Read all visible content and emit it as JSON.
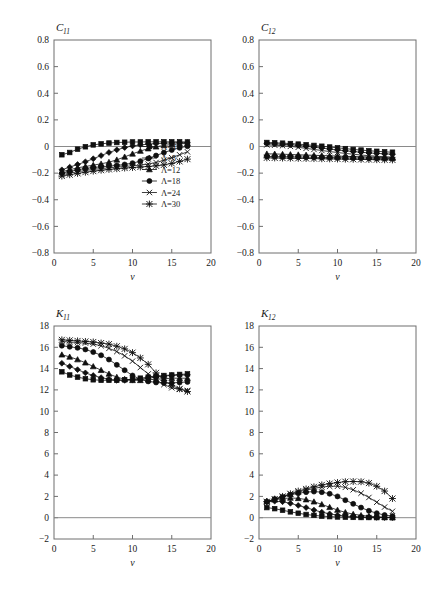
{
  "figure": {
    "panel_count": 4,
    "legend_entries": [
      "Λ=4",
      "Λ=8",
      "Λ=12",
      "Λ=18",
      "Λ=24",
      "Λ=30"
    ],
    "legend_markers": [
      "square",
      "diamond",
      "triangle",
      "circle",
      "cross",
      "asterisk"
    ],
    "line_color": "#101010",
    "frame_color": "#6e6e6e"
  },
  "chart_data": [
    {
      "type": "line",
      "title": "C",
      "title_sub": "11",
      "panel": "top-left",
      "xlabel": "v",
      "ylabel": "",
      "xlim": [
        0,
        20
      ],
      "ylim": [
        -0.8,
        0.8
      ],
      "xticks": [
        0,
        5,
        10,
        15,
        20
      ],
      "yticks": [
        -0.8,
        -0.6,
        -0.4,
        -0.2,
        0,
        0.2,
        0.4,
        0.6,
        0.8
      ],
      "xticklabels": [
        "0",
        "5",
        "10",
        "15",
        "20"
      ],
      "yticklabels": [
        "-0.8",
        "-0.6",
        "-0.4",
        "-0.2",
        "0",
        "0.2",
        "0.4",
        "0.6",
        "0.8"
      ],
      "grid": false,
      "zero_line": true,
      "legend_position": "lower-right",
      "show_legend": true,
      "x": [
        1,
        2,
        3,
        4,
        5,
        6,
        7,
        8,
        9,
        10,
        11,
        12,
        13,
        14,
        15,
        16,
        17
      ],
      "series": [
        {
          "name": "Λ=4",
          "marker": "square",
          "values": [
            -0.062,
            -0.045,
            -0.02,
            -0.002,
            0.012,
            0.02,
            0.026,
            0.03,
            0.032,
            0.034,
            0.034,
            0.035,
            0.035,
            0.035,
            0.035,
            0.035,
            0.034
          ]
        },
        {
          "name": "Λ=8",
          "marker": "diamond",
          "values": [
            -0.175,
            -0.155,
            -0.135,
            -0.115,
            -0.092,
            -0.068,
            -0.045,
            -0.025,
            -0.008,
            0.004,
            0.012,
            0.018,
            0.022,
            0.025,
            0.027,
            0.028,
            0.029
          ]
        },
        {
          "name": "Λ=12",
          "marker": "triangle",
          "values": [
            -0.19,
            -0.175,
            -0.16,
            -0.15,
            -0.14,
            -0.13,
            -0.118,
            -0.1,
            -0.078,
            -0.055,
            -0.034,
            -0.016,
            -0.002,
            0.008,
            0.015,
            0.02,
            0.024
          ]
        },
        {
          "name": "Λ=18",
          "marker": "circle",
          "values": [
            -0.2,
            -0.188,
            -0.175,
            -0.165,
            -0.158,
            -0.152,
            -0.147,
            -0.142,
            -0.135,
            -0.125,
            -0.11,
            -0.09,
            -0.068,
            -0.046,
            -0.026,
            -0.01,
            0.002
          ]
        },
        {
          "name": "Λ=24",
          "marker": "cross",
          "values": [
            -0.212,
            -0.2,
            -0.19,
            -0.18,
            -0.172,
            -0.166,
            -0.16,
            -0.155,
            -0.15,
            -0.145,
            -0.14,
            -0.132,
            -0.12,
            -0.104,
            -0.084,
            -0.062,
            -0.04
          ]
        },
        {
          "name": "Λ=30",
          "marker": "asterisk",
          "values": [
            -0.222,
            -0.212,
            -0.202,
            -0.193,
            -0.185,
            -0.178,
            -0.172,
            -0.167,
            -0.162,
            -0.158,
            -0.154,
            -0.15,
            -0.145,
            -0.138,
            -0.127,
            -0.112,
            -0.095
          ]
        }
      ]
    },
    {
      "type": "line",
      "title": "C",
      "title_sub": "12",
      "panel": "top-right",
      "xlabel": "v",
      "ylabel": "",
      "xlim": [
        0,
        20
      ],
      "ylim": [
        -0.8,
        0.8
      ],
      "xticks": [
        0,
        5,
        10,
        15,
        20
      ],
      "yticks": [
        -0.8,
        -0.6,
        -0.4,
        -0.2,
        0,
        0.2,
        0.4,
        0.6,
        0.8
      ],
      "xticklabels": [
        "0",
        "5",
        "10",
        "15",
        "20"
      ],
      "yticklabels": [
        "-0.8",
        "-0.6",
        "-0.4",
        "-0.2",
        "0",
        "0.2",
        "0.4",
        "0.6",
        "0.8"
      ],
      "grid": false,
      "zero_line": true,
      "legend_position": "none",
      "show_legend": false,
      "x": [
        1,
        2,
        3,
        4,
        5,
        6,
        7,
        8,
        9,
        10,
        11,
        12,
        13,
        14,
        15,
        16,
        17
      ],
      "series": [
        {
          "name": "Λ=4",
          "marker": "square",
          "values": [
            0.03,
            0.028,
            0.025,
            0.022,
            0.018,
            0.013,
            0.008,
            0.002,
            -0.004,
            -0.01,
            -0.016,
            -0.022,
            -0.027,
            -0.032,
            -0.036,
            -0.04,
            -0.043
          ]
        },
        {
          "name": "Λ=8",
          "marker": "diamond",
          "values": [
            0.022,
            0.02,
            0.017,
            0.013,
            0.008,
            0.002,
            -0.005,
            -0.012,
            -0.019,
            -0.026,
            -0.032,
            -0.038,
            -0.043,
            -0.048,
            -0.052,
            -0.055,
            -0.058
          ]
        },
        {
          "name": "Λ=12",
          "marker": "triangle",
          "values": [
            -0.055,
            -0.056,
            -0.058,
            -0.06,
            -0.062,
            -0.064,
            -0.066,
            -0.068,
            -0.07,
            -0.072,
            -0.074,
            -0.076,
            -0.078,
            -0.08,
            -0.082,
            -0.084,
            -0.086
          ]
        },
        {
          "name": "Λ=18",
          "marker": "circle",
          "values": [
            -0.075,
            -0.076,
            -0.077,
            -0.078,
            -0.079,
            -0.08,
            -0.081,
            -0.082,
            -0.083,
            -0.084,
            -0.085,
            -0.086,
            -0.087,
            -0.088,
            -0.089,
            -0.09,
            -0.091
          ]
        },
        {
          "name": "Λ=24",
          "marker": "cross",
          "values": [
            0.012,
            0.01,
            0.006,
            0.001,
            -0.006,
            -0.014,
            -0.022,
            -0.03,
            -0.038,
            -0.045,
            -0.052,
            -0.058,
            -0.064,
            -0.069,
            -0.073,
            -0.077,
            -0.08
          ]
        },
        {
          "name": "Λ=30",
          "marker": "asterisk",
          "values": [
            -0.085,
            -0.086,
            -0.087,
            -0.088,
            -0.089,
            -0.09,
            -0.091,
            -0.092,
            -0.093,
            -0.094,
            -0.095,
            -0.096,
            -0.097,
            -0.098,
            -0.099,
            -0.1,
            -0.101
          ]
        }
      ]
    },
    {
      "type": "line",
      "title": "K",
      "title_sub": "11",
      "panel": "bottom-left",
      "xlabel": "v",
      "ylabel": "",
      "xlim": [
        0,
        20
      ],
      "ylim": [
        -2,
        18
      ],
      "xticks": [
        0,
        5,
        10,
        15,
        20
      ],
      "yticks": [
        -2,
        0,
        2,
        4,
        6,
        8,
        10,
        12,
        14,
        16,
        18
      ],
      "xticklabels": [
        "0",
        "5",
        "10",
        "15",
        "20"
      ],
      "yticklabels": [
        "-2",
        "0",
        "2",
        "4",
        "6",
        "8",
        "10",
        "12",
        "14",
        "16",
        "18"
      ],
      "grid": false,
      "zero_line": true,
      "legend_position": "none",
      "show_legend": false,
      "x": [
        1,
        2,
        3,
        4,
        5,
        6,
        7,
        8,
        9,
        10,
        11,
        12,
        13,
        14,
        15,
        16,
        17
      ],
      "series": [
        {
          "name": "Λ=4",
          "marker": "square",
          "values": [
            13.7,
            13.4,
            13.2,
            13.05,
            12.95,
            12.9,
            12.9,
            12.9,
            12.95,
            13.0,
            13.1,
            13.2,
            13.3,
            13.35,
            13.4,
            13.45,
            13.5
          ]
        },
        {
          "name": "Λ=8",
          "marker": "diamond",
          "values": [
            14.5,
            14.2,
            13.9,
            13.6,
            13.35,
            13.15,
            13.0,
            12.9,
            12.9,
            12.95,
            13.0,
            13.1,
            13.2,
            13.3,
            13.35,
            13.4,
            13.4
          ]
        },
        {
          "name": "Λ=12",
          "marker": "triangle",
          "values": [
            15.3,
            15.1,
            14.85,
            14.55,
            14.2,
            13.85,
            13.5,
            13.2,
            13.0,
            12.9,
            12.9,
            12.95,
            13.0,
            13.05,
            13.1,
            13.1,
            13.1
          ]
        },
        {
          "name": "Λ=18",
          "marker": "circle",
          "values": [
            16.15,
            16.05,
            15.95,
            15.8,
            15.55,
            15.25,
            14.85,
            14.35,
            13.85,
            13.35,
            13.0,
            12.8,
            12.7,
            12.65,
            12.65,
            12.7,
            12.75
          ]
        },
        {
          "name": "Λ=24",
          "marker": "cross",
          "values": [
            16.55,
            16.5,
            16.45,
            16.4,
            16.3,
            16.15,
            15.9,
            15.6,
            15.2,
            14.7,
            14.1,
            13.5,
            12.95,
            12.5,
            12.2,
            12.05,
            11.95
          ]
        },
        {
          "name": "Λ=30",
          "marker": "asterisk",
          "values": [
            16.7,
            16.65,
            16.6,
            16.55,
            16.5,
            16.4,
            16.3,
            16.1,
            15.85,
            15.5,
            15.0,
            14.4,
            13.6,
            12.9,
            12.4,
            12.1,
            11.85
          ]
        }
      ]
    },
    {
      "type": "line",
      "title": "K",
      "title_sub": "12",
      "panel": "bottom-right",
      "xlabel": "v",
      "ylabel": "",
      "xlim": [
        0,
        20
      ],
      "ylim": [
        -2,
        18
      ],
      "xticks": [
        0,
        5,
        10,
        15,
        20
      ],
      "yticks": [
        -2,
        0,
        2,
        4,
        6,
        8,
        10,
        12,
        14,
        16,
        18
      ],
      "xticklabels": [
        "0",
        "5",
        "10",
        "15",
        "20"
      ],
      "yticklabels": [
        "-2",
        "0",
        "2",
        "4",
        "6",
        "8",
        "10",
        "12",
        "14",
        "16",
        "18"
      ],
      "grid": false,
      "zero_line": true,
      "legend_position": "none",
      "show_legend": false,
      "x": [
        1,
        2,
        3,
        4,
        5,
        6,
        7,
        8,
        9,
        10,
        11,
        12,
        13,
        14,
        15,
        16,
        17
      ],
      "series": [
        {
          "name": "Λ=4",
          "marker": "square",
          "values": [
            0.95,
            0.85,
            0.7,
            0.55,
            0.42,
            0.3,
            0.22,
            0.15,
            0.1,
            0.07,
            0.05,
            0.03,
            0.02,
            0.02,
            0.01,
            0.01,
            0.0
          ]
        },
        {
          "name": "Λ=8",
          "marker": "diamond",
          "values": [
            1.5,
            1.55,
            1.5,
            1.35,
            1.15,
            0.95,
            0.72,
            0.52,
            0.36,
            0.24,
            0.16,
            0.1,
            0.07,
            0.05,
            0.03,
            0.02,
            0.01
          ]
        },
        {
          "name": "Λ=12",
          "marker": "triangle",
          "values": [
            1.55,
            1.7,
            1.8,
            1.85,
            1.82,
            1.7,
            1.5,
            1.25,
            0.98,
            0.72,
            0.5,
            0.33,
            0.22,
            0.14,
            0.09,
            0.05,
            0.03
          ]
        },
        {
          "name": "Λ=18",
          "marker": "circle",
          "values": [
            1.5,
            1.75,
            1.95,
            2.15,
            2.3,
            2.4,
            2.45,
            2.4,
            2.25,
            2.0,
            1.65,
            1.3,
            0.95,
            0.65,
            0.42,
            0.25,
            0.15
          ]
        },
        {
          "name": "Λ=24",
          "marker": "cross",
          "values": [
            1.45,
            1.7,
            1.95,
            2.2,
            2.42,
            2.6,
            2.75,
            2.88,
            2.95,
            2.95,
            2.85,
            2.62,
            2.3,
            1.9,
            1.45,
            1.0,
            0.6
          ]
        },
        {
          "name": "Λ=30",
          "marker": "asterisk",
          "values": [
            1.5,
            1.75,
            2.0,
            2.25,
            2.5,
            2.7,
            2.9,
            3.08,
            3.2,
            3.3,
            3.38,
            3.4,
            3.38,
            3.25,
            2.95,
            2.5,
            1.8
          ]
        }
      ]
    }
  ]
}
